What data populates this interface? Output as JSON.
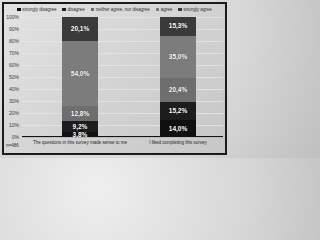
{
  "chart_data": {
    "type": "bar",
    "stacked": true,
    "title": "",
    "xlabel": "",
    "ylabel": "",
    "ylim": [
      0,
      100
    ],
    "grid": true,
    "legend_position": "top",
    "categories": [
      "The questions in this survey made sense to me",
      "I liked completing this survey"
    ],
    "series": [
      {
        "name": "strongly disagree",
        "values": [
          3.8,
          14.0
        ],
        "labels": [
          "3,8%",
          "14,0%"
        ],
        "color": "#101010"
      },
      {
        "name": "disagree",
        "values": [
          9.2,
          15.2
        ],
        "labels": [
          "9,2%",
          "15,2%"
        ],
        "color": "#1d1d1d"
      },
      {
        "name": "neither agree, nor disagree",
        "values": [
          12.8,
          20.4
        ],
        "labels": [
          "12,8%",
          "20,4%"
        ],
        "color": "#6e6e6e"
      },
      {
        "name": "agree",
        "values": [
          54.0,
          35.0
        ],
        "labels": [
          "54,0%",
          "35,0%"
        ],
        "color": "#7c7c7c"
      },
      {
        "name": "strongly agree",
        "values": [
          20.1,
          15.3
        ],
        "labels": [
          "20,1%",
          "15,3%"
        ],
        "color": "#3a3a3a"
      }
    ],
    "yticks": [
      "100%",
      "90%",
      "80%",
      "70%",
      "60%",
      "50%",
      "40%",
      "30%",
      "20%",
      "10%",
      "0%"
    ],
    "annotation": "n=486"
  }
}
